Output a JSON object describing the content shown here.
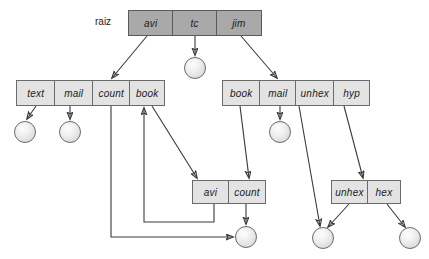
{
  "diagram": {
    "title": "raiz",
    "root_label": "raiz",
    "colors": {
      "root_fill": "#a9a9a9",
      "node_fill": "#e3e3e3",
      "node_border": "#6b6b6b",
      "edge": "#3a3a3a",
      "leaf_fill": "#eeeeee",
      "text": "#1a1a1a",
      "background": "#ffffff"
    },
    "nodes": [
      {
        "id": "root",
        "name": "root-node",
        "is_root": true,
        "x": 128,
        "y": 10,
        "width": 134,
        "height": 26,
        "cells": [
          {
            "label": "avi",
            "width": 45
          },
          {
            "label": "tc",
            "width": 44
          },
          {
            "label": "jim",
            "width": 45
          }
        ]
      },
      {
        "id": "left-row",
        "name": "left-branch-node",
        "is_root": false,
        "x": 16,
        "y": 80,
        "width": 149,
        "height": 26,
        "cells": [
          {
            "label": "text",
            "width": 39
          },
          {
            "label": "mail",
            "width": 38
          },
          {
            "label": "count",
            "width": 38
          },
          {
            "label": "book",
            "width": 34
          }
        ]
      },
      {
        "id": "right-row",
        "name": "right-branch-node",
        "is_root": false,
        "x": 222,
        "y": 80,
        "width": 148,
        "height": 26,
        "cells": [
          {
            "label": "book",
            "width": 38
          },
          {
            "label": "mail",
            "width": 36
          },
          {
            "label": "unhex",
            "width": 39
          },
          {
            "label": "hyp",
            "width": 35
          }
        ]
      },
      {
        "id": "avi-count",
        "name": "avi-count-node",
        "is_root": false,
        "x": 192,
        "y": 180,
        "width": 74,
        "height": 24,
        "cells": [
          {
            "label": "avi",
            "width": 37
          },
          {
            "label": "count",
            "width": 37
          }
        ]
      },
      {
        "id": "unhex-hex",
        "name": "unhex-hex-node",
        "is_root": false,
        "x": 331,
        "y": 180,
        "width": 70,
        "height": 24,
        "cells": [
          {
            "label": "unhex",
            "width": 37
          },
          {
            "label": "hex",
            "width": 33
          }
        ]
      }
    ],
    "leaves": [
      {
        "id": "leaf-tc",
        "name": "leaf-node-tc",
        "cx": 195,
        "cy": 68,
        "r": 11
      },
      {
        "id": "leaf-text",
        "name": "leaf-node-text",
        "cx": 25,
        "cy": 132,
        "r": 11
      },
      {
        "id": "leaf-mail-l",
        "name": "leaf-node-mail-left",
        "cx": 70,
        "cy": 132,
        "r": 11
      },
      {
        "id": "leaf-mail-r",
        "name": "leaf-node-mail-right",
        "cx": 280,
        "cy": 132,
        "r": 11
      },
      {
        "id": "leaf-bottom",
        "name": "leaf-node-shared-bottom",
        "cx": 246,
        "cy": 237,
        "r": 11
      },
      {
        "id": "leaf-unhex",
        "name": "leaf-node-unhex",
        "cx": 323,
        "cy": 238,
        "r": 11
      },
      {
        "id": "leaf-hex",
        "name": "leaf-node-hex",
        "cx": 410,
        "cy": 238,
        "r": 11
      }
    ],
    "edges": [
      {
        "name": "edge-root-avi-to-left-row",
        "from": "root.avi",
        "to": "left-row.count",
        "style": "diagonal"
      },
      {
        "name": "edge-root-tc-to-leaf",
        "from": "root.tc",
        "to": "leaf-tc",
        "style": "straight"
      },
      {
        "name": "edge-root-jim-to-right-row",
        "from": "root.jim",
        "to": "right-row.mail",
        "style": "diagonal"
      },
      {
        "name": "edge-text-to-leaf",
        "from": "left-row.text",
        "to": "leaf-text",
        "style": "diagonal"
      },
      {
        "name": "edge-mail-left-to-leaf",
        "from": "left-row.mail",
        "to": "leaf-mail-left",
        "style": "straight"
      },
      {
        "name": "edge-count-left-to-bottom-leaf",
        "from": "left-row.count",
        "to": "leaf-bottom",
        "style": "orthogonal"
      },
      {
        "name": "edge-book-left-to-avi-count",
        "from": "left-row.book",
        "to": "avi-count",
        "style": "diagonal"
      },
      {
        "name": "edge-avi-back-to-book-left",
        "from": "avi-count.avi",
        "to": "left-row.book",
        "style": "orthogonal"
      },
      {
        "name": "edge-book-right-to-avi-count",
        "from": "right-row.book",
        "to": "avi-count",
        "style": "diagonal"
      },
      {
        "name": "edge-mail-right-to-leaf",
        "from": "right-row.mail",
        "to": "leaf-mail-right",
        "style": "straight"
      },
      {
        "name": "edge-unhex-right-to-leaf",
        "from": "right-row.unhex",
        "to": "leaf-unhex",
        "style": "diagonal"
      },
      {
        "name": "edge-hyp-to-unhex-hex",
        "from": "right-row.hyp",
        "to": "unhex-hex",
        "style": "diagonal"
      },
      {
        "name": "edge-count-to-bottom-leaf",
        "from": "avi-count.count",
        "to": "leaf-bottom",
        "style": "straight"
      },
      {
        "name": "edge-unhex-node-to-leaf",
        "from": "unhex-hex.unhex",
        "to": "leaf-unhex",
        "style": "diagonal"
      },
      {
        "name": "edge-hex-node-to-leaf",
        "from": "unhex-hex.hex",
        "to": "leaf-hex",
        "style": "diagonal"
      }
    ]
  }
}
